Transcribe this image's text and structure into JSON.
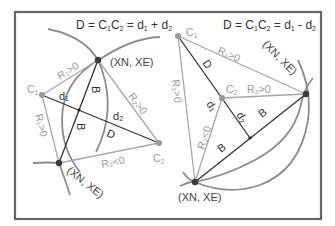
{
  "colors": {
    "frame": "#666666",
    "arc": "#8c8c8c",
    "light_line": "#a8a8a8",
    "dark_line": "#333333",
    "point_dark": "#3a3a3a",
    "point_light": "#9a9a9a"
  },
  "left_diagram": {
    "title": "D = C₁C₂ = d₁ + d₂",
    "title_parts": [
      "D = C",
      "C",
      " = d",
      " + d"
    ],
    "subscripts": [
      "1",
      "2",
      "1",
      "2"
    ],
    "points": {
      "c1": {
        "label": "C",
        "sub": "1"
      },
      "c2": {
        "label": "C",
        "sub": "2"
      },
      "upper_intersection": {
        "label": "(XN, XE)"
      },
      "lower_intersection": {
        "label": "(XN, XE)"
      }
    },
    "line_labels": {
      "r1_upper": "R₁>0",
      "r2_upper": "R₂>0",
      "r1_lower": "R₁>0",
      "r2_lower": "R₂<0",
      "d1": "d₁",
      "d2": "d₂",
      "D": "D",
      "B_upper": "B",
      "B_lower": "B"
    }
  },
  "right_diagram": {
    "title": "D = C₁C₂ = d₁ - d₂",
    "title_parts": [
      "D = C",
      "C",
      " = d",
      " - d"
    ],
    "subscripts": [
      "1",
      "2",
      "1",
      "2"
    ],
    "points": {
      "c1": {
        "label": "C",
        "sub": "1"
      },
      "c2": {
        "label": "C",
        "sub": "2"
      },
      "right_intersection": {
        "label": "(XN, XE)"
      },
      "lower_intersection": {
        "label": "(XN, XE)"
      }
    },
    "line_labels": {
      "r1_top": "R₁>0",
      "r2_mid": "R₂>0",
      "r1_left": "R₁>0",
      "r2_low": "R₂<0",
      "d1": "d₁",
      "d2": "d₂",
      "D": "D",
      "B_right": "B",
      "B_left": "B"
    }
  }
}
